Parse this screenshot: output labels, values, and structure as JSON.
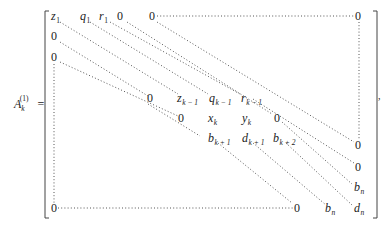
{
  "equation": {
    "lhs": {
      "symbol": "A",
      "subscript": "k",
      "superscript": "(1)",
      "equals": "="
    },
    "trailing_punctuation": ",",
    "matrix": {
      "row_1": [
        {
          "base": "z",
          "sub": "1"
        },
        {
          "base": "q",
          "sub": "1"
        },
        {
          "base": "r",
          "sub": "1"
        },
        {
          "base": "0"
        },
        {
          "base": "0"
        },
        {
          "base": "0"
        }
      ],
      "row_2": [
        {
          "base": "0"
        }
      ],
      "row_3": [
        {
          "base": "0"
        }
      ],
      "row_k_minus_1": [
        {
          "base": "0"
        },
        {
          "base": "z",
          "sub": "k − 1"
        },
        {
          "base": "q",
          "sub": "k − 1"
        },
        {
          "base": "r",
          "sub": "k − 1"
        },
        {
          "base": "0"
        }
      ],
      "row_k": [
        {
          "base": "0"
        },
        {
          "base": "x",
          "sub": "k"
        },
        {
          "base": "y",
          "sub": "k"
        },
        {
          "base": "0"
        },
        {
          "base": "0"
        }
      ],
      "row_k_plus_1": [
        {
          "base": "b",
          "sub": "k + 1"
        },
        {
          "base": "d",
          "sub": "k + 1"
        },
        {
          "base": "b",
          "sub": "k + 2"
        },
        {
          "base": "b",
          "sub": "n"
        }
      ],
      "row_n": [
        {
          "base": "0"
        },
        {
          "base": "0"
        },
        {
          "base": "b",
          "sub": "n"
        },
        {
          "base": "d",
          "sub": "n"
        }
      ]
    }
  }
}
